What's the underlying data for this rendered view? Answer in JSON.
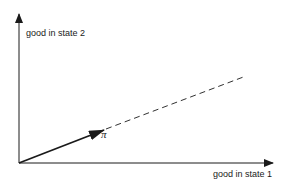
{
  "diagram": {
    "y_axis_label": "good in state 2",
    "x_axis_label": "good in state 1",
    "vector_label": "π",
    "colors": {
      "ink": "#1a1a1a",
      "background": "#ffffff"
    }
  }
}
